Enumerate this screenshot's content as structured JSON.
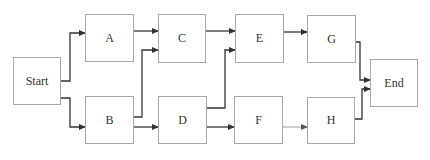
{
  "diagram": {
    "type": "flowchart",
    "nodes": [
      {
        "id": "start",
        "label": "Start",
        "x": 13,
        "y": 57,
        "w": 48,
        "h": 48
      },
      {
        "id": "a",
        "label": "A",
        "x": 85,
        "y": 14,
        "w": 49,
        "h": 48
      },
      {
        "id": "c",
        "label": "C",
        "x": 158,
        "y": 14,
        "w": 48,
        "h": 49
      },
      {
        "id": "e",
        "label": "E",
        "x": 235,
        "y": 14,
        "w": 49,
        "h": 49
      },
      {
        "id": "g",
        "label": "G",
        "x": 307,
        "y": 15,
        "w": 49,
        "h": 48
      },
      {
        "id": "b",
        "label": "B",
        "x": 85,
        "y": 96,
        "w": 49,
        "h": 48
      },
      {
        "id": "d",
        "label": "D",
        "x": 158,
        "y": 96,
        "w": 49,
        "h": 48
      },
      {
        "id": "f",
        "label": "F",
        "x": 234,
        "y": 96,
        "w": 49,
        "h": 48
      },
      {
        "id": "h",
        "label": "H",
        "x": 307,
        "y": 97,
        "w": 48,
        "h": 47
      },
      {
        "id": "end",
        "label": "End",
        "x": 370,
        "y": 59,
        "w": 48,
        "h": 48
      }
    ],
    "edges": [
      {
        "from": "start",
        "to": "a",
        "points": [
          [
            61,
            81
          ],
          [
            70,
            81
          ],
          [
            70,
            33
          ],
          [
            85,
            33
          ]
        ],
        "color": "#333333"
      },
      {
        "from": "start",
        "to": "b",
        "points": [
          [
            61,
            98
          ],
          [
            70,
            98
          ],
          [
            70,
            127
          ],
          [
            85,
            127
          ]
        ],
        "color": "#333333"
      },
      {
        "from": "a",
        "to": "c",
        "points": [
          [
            134,
            31
          ],
          [
            158,
            31
          ]
        ],
        "color": "#333333"
      },
      {
        "from": "b",
        "to": "c",
        "points": [
          [
            134,
            117
          ],
          [
            142,
            117
          ],
          [
            142,
            50
          ],
          [
            158,
            50
          ]
        ],
        "color": "#333333"
      },
      {
        "from": "b",
        "to": "d",
        "points": [
          [
            134,
            127
          ],
          [
            158,
            127
          ]
        ],
        "color": "#333333"
      },
      {
        "from": "c",
        "to": "e",
        "points": [
          [
            206,
            31
          ],
          [
            235,
            31
          ]
        ],
        "color": "#333333"
      },
      {
        "from": "d",
        "to": "e",
        "points": [
          [
            207,
            108
          ],
          [
            225,
            108
          ],
          [
            225,
            50
          ],
          [
            235,
            50
          ]
        ],
        "color": "#333333"
      },
      {
        "from": "d",
        "to": "f",
        "points": [
          [
            207,
            127
          ],
          [
            234,
            127
          ]
        ],
        "color": "#333333"
      },
      {
        "from": "e",
        "to": "g",
        "points": [
          [
            284,
            32
          ],
          [
            307,
            32
          ]
        ],
        "color": "#333333"
      },
      {
        "from": "f",
        "to": "h",
        "points": [
          [
            283,
            127
          ],
          [
            307,
            127
          ]
        ],
        "color": "#9a9a9a"
      },
      {
        "from": "g",
        "to": "end",
        "points": [
          [
            356,
            42
          ],
          [
            360,
            42
          ],
          [
            360,
            80
          ],
          [
            370,
            80
          ]
        ],
        "color": "#333333"
      },
      {
        "from": "h",
        "to": "end",
        "points": [
          [
            355,
            119
          ],
          [
            362,
            119
          ],
          [
            362,
            89
          ],
          [
            370,
            89
          ]
        ],
        "color": "#333333"
      }
    ],
    "style": {
      "node_border": "#a8a8a8",
      "edge_color": "#333333",
      "background": "#ffffff"
    }
  }
}
